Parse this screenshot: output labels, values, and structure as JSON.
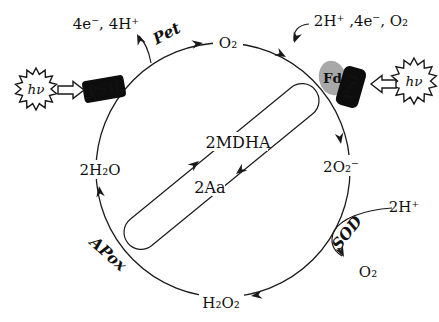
{
  "diagram": {
    "labels": {
      "electrons_protons_out": "4e⁻, 4H⁺",
      "pet": "Pet",
      "oxygen_top": "O₂",
      "inputs_top_right": "2H⁺ ,4e⁻, O₂",
      "photon_left": "hν",
      "photon_right": "hν",
      "psii": "PSII",
      "fd": "Fd",
      "psi": "PSI",
      "water": "2H₂O",
      "superoxide": "2O₂⁻",
      "mdha": "2MDHA",
      "ascorbate": "2Aa",
      "sod": "SOD",
      "protons_right": "2H⁺",
      "oxygen_right": "O₂",
      "hydrogen_peroxide": "H₂O₂",
      "apox": "APox"
    },
    "colors": {
      "line": "#1a1a1a",
      "box_fill": "#0d0d0d",
      "box_text": "#ffffff",
      "fd_fill": "#a8a8a8",
      "background": "#ffffff"
    },
    "icons": {
      "left_light": "starburst-light-icon",
      "right_light": "starburst-light-icon",
      "left_pointer": "block-arrow-right-icon",
      "right_pointer": "block-arrow-left-icon"
    }
  }
}
